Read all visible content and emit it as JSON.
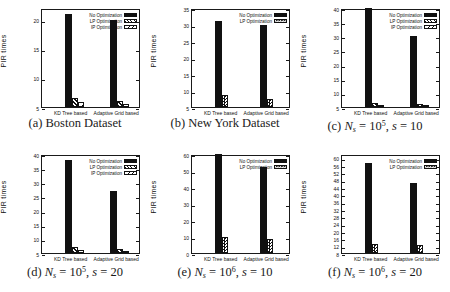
{
  "figure": {
    "background": "#ffffff",
    "ink": "#111111",
    "ylabel": "PIR times",
    "categories": [
      "KD Tree based",
      "Adaptive Grid based"
    ]
  },
  "chart_data": [
    {
      "id": "a",
      "type": "bar",
      "caption": {
        "prefix": "(a)",
        "kind": "text",
        "text": "Boston Dataset"
      },
      "ylabel": "PIR times",
      "xlabel": "",
      "categories": [
        "KD Tree based",
        "Adaptive Grid based"
      ],
      "ylim": [
        5,
        22
      ],
      "yticks": [
        5,
        10,
        15,
        20
      ],
      "grid": false,
      "legend_position": "top-right",
      "series": [
        {
          "name": "No Optimization",
          "pattern": "solid",
          "values": [
            21,
            20
          ]
        },
        {
          "name": "LP Optimization",
          "pattern": "diag",
          "values": [
            6.5,
            6
          ]
        },
        {
          "name": "IP Optimization",
          "pattern": "diag-light",
          "values": [
            5.8,
            5.5
          ]
        }
      ]
    },
    {
      "id": "b",
      "type": "bar",
      "caption": {
        "prefix": "(b)",
        "kind": "text",
        "text": "New York Dataset"
      },
      "ylabel": "PIR times",
      "xlabel": "",
      "categories": [
        "KD Tree based",
        "Adaptive Grid based"
      ],
      "ylim": [
        5,
        35
      ],
      "yticks": [
        5,
        10,
        15,
        20,
        25,
        30,
        35
      ],
      "grid": false,
      "legend_position": "top-right",
      "series": [
        {
          "name": "No Optimization",
          "pattern": "solid",
          "values": [
            31,
            30
          ]
        },
        {
          "name": "LP Optimization",
          "pattern": "checker",
          "values": [
            8.5,
            7.5
          ]
        }
      ]
    },
    {
      "id": "c",
      "type": "bar",
      "caption": {
        "prefix": "(c)",
        "kind": "math",
        "ns_exp": "5",
        "s_val": "10"
      },
      "ylabel": "PIR times",
      "xlabel": "",
      "categories": [
        "KD Tree based",
        "Adaptive Grid based"
      ],
      "ylim": [
        5,
        40
      ],
      "yticks": [
        5,
        10,
        15,
        20,
        25,
        30,
        35,
        40
      ],
      "grid": false,
      "legend_position": "top-right",
      "series": [
        {
          "name": "No Optimization",
          "pattern": "solid",
          "values": [
            40,
            30
          ]
        },
        {
          "name": "LP Optimization",
          "pattern": "diag",
          "values": [
            6.5,
            6.2
          ]
        },
        {
          "name": "IP Optimization",
          "pattern": "diag-light",
          "values": [
            5.8,
            5.6
          ]
        }
      ]
    },
    {
      "id": "d",
      "type": "bar",
      "caption": {
        "prefix": "(d)",
        "kind": "math",
        "ns_exp": "5",
        "s_val": "20"
      },
      "ylabel": "PIR times",
      "xlabel": "",
      "categories": [
        "KD Tree based",
        "Adaptive Grid based"
      ],
      "ylim": [
        5,
        40
      ],
      "yticks": [
        5,
        10,
        15,
        20,
        25,
        30,
        35,
        40
      ],
      "grid": false,
      "legend_position": "top-right",
      "series": [
        {
          "name": "No Optimization",
          "pattern": "solid",
          "values": [
            38,
            27
          ]
        },
        {
          "name": "LP Optimization",
          "pattern": "diag",
          "values": [
            7,
            6.5
          ]
        },
        {
          "name": "IP Optimization",
          "pattern": "diag-light",
          "values": [
            6,
            5.8
          ]
        }
      ]
    },
    {
      "id": "e",
      "type": "bar",
      "caption": {
        "prefix": "(e)",
        "kind": "math",
        "ns_exp": "6",
        "s_val": "10"
      },
      "ylabel": "PIR times",
      "xlabel": "",
      "categories": [
        "KD Tree based",
        "Adaptive Grid based"
      ],
      "ylim": [
        0,
        60
      ],
      "yticks": [
        0,
        10,
        20,
        30,
        40,
        50,
        60
      ],
      "grid": false,
      "legend_position": "top-right",
      "series": [
        {
          "name": "No Optimization",
          "pattern": "solid",
          "values": [
            60,
            52
          ]
        },
        {
          "name": "LP Optimization",
          "pattern": "checker",
          "values": [
            9.5,
            8.5
          ]
        }
      ]
    },
    {
      "id": "f",
      "type": "bar",
      "caption": {
        "prefix": "(f)",
        "kind": "math",
        "ns_exp": "6",
        "s_val": "20"
      },
      "ylabel": "PIR times",
      "xlabel": "",
      "categories": [
        "KD Tree based",
        "Adaptive Grid based"
      ],
      "ylim": [
        8,
        62
      ],
      "yticks": [
        8,
        12,
        16,
        20,
        24,
        28,
        32,
        36,
        40,
        44,
        48,
        52,
        56,
        60
      ],
      "grid": false,
      "legend_position": "top-right",
      "series": [
        {
          "name": "No Optimization",
          "pattern": "solid",
          "values": [
            57,
            46
          ]
        },
        {
          "name": "LP Optimization",
          "pattern": "checker",
          "values": [
            13,
            12.5
          ]
        }
      ]
    }
  ]
}
